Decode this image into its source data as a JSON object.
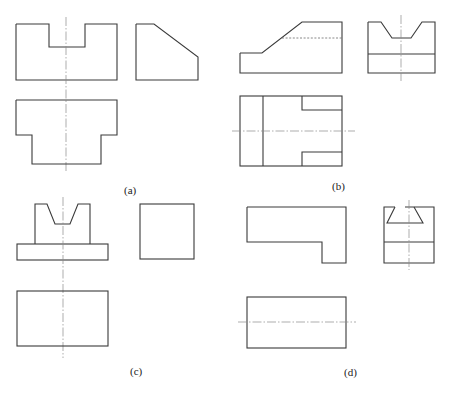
{
  "figure": {
    "panels": [
      {
        "id": "a",
        "label": "(a)"
      },
      {
        "id": "b",
        "label": "(b)"
      },
      {
        "id": "c",
        "label": "(c)"
      },
      {
        "id": "d",
        "label": "(d)"
      }
    ]
  },
  "colors": {
    "outline": "#3a3a3a",
    "centerline": "#8a8a8a",
    "hidden_line": "#6a6a6a",
    "background": "#ffffff"
  }
}
